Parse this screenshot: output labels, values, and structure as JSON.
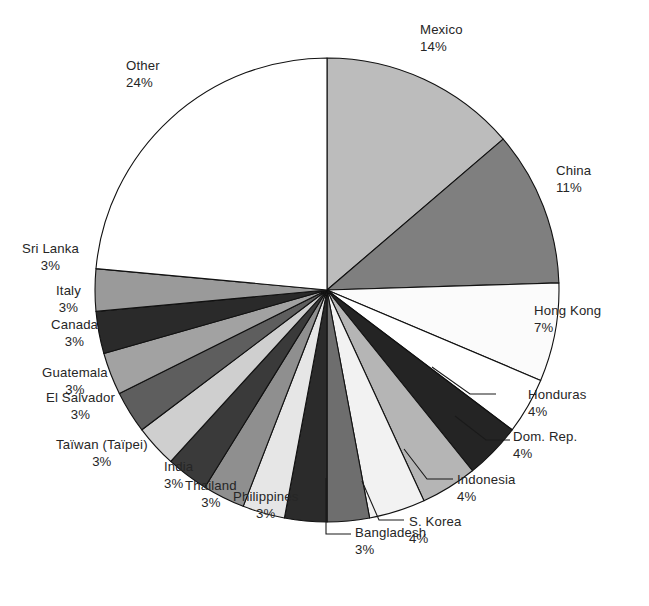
{
  "chart_data": {
    "type": "pie",
    "title": "",
    "subtitle": "",
    "xlabel": "",
    "ylabel": "",
    "legend_position": "none",
    "grid": false,
    "units": "percent",
    "start_angle_deg": 0,
    "direction": "clockwise",
    "categories": [
      "Mexico",
      "China",
      "Hong Kong",
      "Honduras",
      "Dom. Rep.",
      "Indonesia",
      "S. Korea",
      "Bangladesh",
      "Philippines",
      "Thailand",
      "India",
      "Taïwan (Taïpei)",
      "El Salvador",
      "Guatemala",
      "Canada",
      "Italy",
      "Sri Lanka",
      "Other"
    ],
    "values": [
      14,
      11,
      7,
      4,
      4,
      4,
      4,
      3,
      3,
      3,
      3,
      3,
      3,
      3,
      3,
      3,
      3,
      24
    ],
    "colors": [
      "#bcbcbc",
      "#7f7f7f",
      "#fbfbfb",
      "#ffffff",
      "#242424",
      "#b5b5b5",
      "#f2f2f2",
      "#6e6e6e",
      "#2b2b2b",
      "#e6e6e6",
      "#8f8f8f",
      "#3a3a3a",
      "#cfcfcf",
      "#5e5e5e",
      "#a2a2a2",
      "#2a2a2a",
      "#9a9a9a",
      "#ffffff"
    ],
    "slice_border_color": "#111111",
    "labels": [
      {
        "name": "Mexico",
        "pct": "14%"
      },
      {
        "name": "China",
        "pct": "11%"
      },
      {
        "name": "Hong Kong",
        "pct": "7%"
      },
      {
        "name": "Honduras",
        "pct": "4%"
      },
      {
        "name": "Dom. Rep.",
        "pct": "4%"
      },
      {
        "name": "Indonesia",
        "pct": "4%"
      },
      {
        "name": "S. Korea",
        "pct": "4%"
      },
      {
        "name": "Bangladesh",
        "pct": "3%"
      },
      {
        "name": "Philippines",
        "pct": "3%"
      },
      {
        "name": "Thailand",
        "pct": "3%"
      },
      {
        "name": "India",
        "pct": "3%"
      },
      {
        "name": "Taïwan (Taïpei)",
        "pct": "3%"
      },
      {
        "name": "El Salvador",
        "pct": "3%"
      },
      {
        "name": "Guatemala",
        "pct": "3%"
      },
      {
        "name": "Canada",
        "pct": "3%"
      },
      {
        "name": "Italy",
        "pct": "3%"
      },
      {
        "name": "Sri Lanka",
        "pct": "3%"
      },
      {
        "name": "Other",
        "pct": "24%"
      }
    ]
  },
  "geometry": {
    "center_x": 327,
    "center_y": 290,
    "radius": 232
  },
  "label_positions": [
    {
      "key": "mexico",
      "left": 420,
      "top": 22,
      "align": "align-left",
      "pct": "pct-left"
    },
    {
      "key": "china",
      "left": 556,
      "top": 163,
      "align": "align-left",
      "pct": "pct-left"
    },
    {
      "key": "hongkong",
      "left": 534,
      "top": 303,
      "align": "align-left",
      "pct": "pct-left"
    },
    {
      "key": "honduras",
      "left": 528,
      "top": 387,
      "align": "align-left",
      "pct": "pct-left"
    },
    {
      "key": "domrep",
      "left": 513,
      "top": 429,
      "align": "align-left",
      "pct": "pct-left"
    },
    {
      "key": "indonesia",
      "left": 457,
      "top": 472,
      "align": "align-left",
      "pct": "pct-left"
    },
    {
      "key": "skorea",
      "left": 409,
      "top": 514,
      "align": "align-left",
      "pct": "pct-left"
    },
    {
      "key": "bangladesh",
      "left": 355,
      "top": 525,
      "align": "align-left",
      "pct": "pct-left"
    },
    {
      "key": "philippines",
      "left": 233,
      "top": 489,
      "align": "align-left",
      "pct": "pct-center"
    },
    {
      "key": "thailand",
      "left": 185,
      "top": 478,
      "align": "align-left",
      "pct": "pct-center"
    },
    {
      "key": "india",
      "left": 164,
      "top": 459,
      "align": "align-left",
      "pct": "pct-left"
    },
    {
      "key": "taiwan",
      "left": 56,
      "top": 437,
      "align": "align-left",
      "pct": "pct-center"
    },
    {
      "key": "elsalvador",
      "left": 46,
      "top": 390,
      "align": "align-left",
      "pct": "pct-center"
    },
    {
      "key": "guatemala",
      "left": 42,
      "top": 365,
      "align": "align-left",
      "pct": "pct-center"
    },
    {
      "key": "canada",
      "left": 51,
      "top": 317,
      "align": "align-left",
      "pct": "pct-center"
    },
    {
      "key": "italy",
      "left": 56,
      "top": 283,
      "align": "align-left",
      "pct": "pct-center"
    },
    {
      "key": "srilanka",
      "left": 22,
      "top": 241,
      "align": "align-left",
      "pct": "pct-center"
    },
    {
      "key": "other",
      "left": 126,
      "top": 58,
      "align": "align-left",
      "pct": "pct-left"
    }
  ],
  "leader_lines": [
    {
      "name": "leader-honduras",
      "points": "496,394 470,394 432,367"
    },
    {
      "name": "leader-domrep",
      "points": "510,440 486,440 455,416"
    },
    {
      "name": "leader-indonesia",
      "points": "453,479 427,479 404,449"
    },
    {
      "name": "leader-skorea",
      "points": "404,520 379,520 362,481"
    },
    {
      "name": "leader-bangladesh",
      "points": "351,534 326,534 326,478"
    },
    {
      "name": "leader-philippines",
      "points": "300,497 300,497 300,497"
    }
  ]
}
